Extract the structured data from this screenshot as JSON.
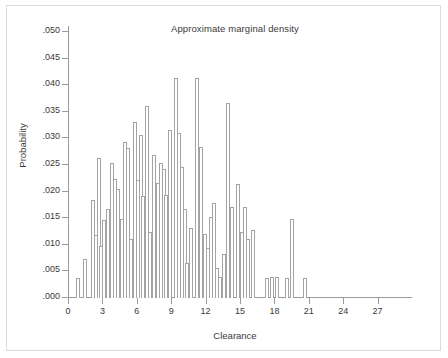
{
  "figure": {
    "title": "Approximate marginal density",
    "x_axis_label": "Clearance",
    "y_axis_label": "Probability",
    "border_color": "#dcdcdc",
    "axis_color": "#9a9a9a",
    "bar_outline_color": "#a3a3a3",
    "bar_fill_color": "#ffffff",
    "background_color": "#ffffff"
  },
  "chart_data": {
    "type": "bar",
    "title": "Approximate marginal density",
    "xlabel": "Clearance",
    "ylabel": "Probability",
    "xlim": [
      0,
      30
    ],
    "ylim": [
      0,
      0.05
    ],
    "grid": false,
    "legend": null,
    "x_ticks": [
      "0",
      "3",
      "6",
      "9",
      "12",
      "15",
      "18",
      "21",
      "24",
      "27"
    ],
    "x_tick_values": [
      0,
      3,
      6,
      9,
      12,
      15,
      18,
      21,
      24,
      27
    ],
    "y_ticks": [
      ".000",
      ".005",
      ".010",
      ".015",
      ".020",
      ".025",
      ".030",
      ".035",
      ".040",
      ".045",
      ".050"
    ],
    "y_tick_values": [
      0.0,
      0.005,
      0.01,
      0.015,
      0.02,
      0.025,
      0.03,
      0.035,
      0.04,
      0.045,
      0.05
    ],
    "bin_width": 0.33,
    "x": [
      0.83,
      1.5,
      2.17,
      2.33,
      2.67,
      3.0,
      3.17,
      3.5,
      3.83,
      4.0,
      4.33,
      4.67,
      5.0,
      5.17,
      5.5,
      5.83,
      6.0,
      6.33,
      6.5,
      6.83,
      7.0,
      7.17,
      7.5,
      7.83,
      8.0,
      8.33,
      8.5,
      8.83,
      9.0,
      9.17,
      9.5,
      9.83,
      10.0,
      10.33,
      10.5,
      10.83,
      11.0,
      11.33,
      11.5,
      11.83,
      12.0,
      12.33,
      12.5,
      12.83,
      13.0,
      13.33,
      13.5,
      13.83,
      14.0,
      14.33,
      14.5,
      14.83,
      15.0,
      15.33,
      15.5,
      15.83,
      16.0,
      16.33,
      17.33,
      17.83,
      18.17,
      18.5,
      19.0,
      19.33,
      20.67
    ],
    "values": [
      0.0038,
      0.0074,
      0.0185,
      0.0119,
      0.0263,
      0.0098,
      0.0147,
      0.0167,
      0.0253,
      0.0223,
      0.0205,
      0.0148,
      0.0293,
      0.0282,
      0.011,
      0.0331,
      0.0221,
      0.0306,
      0.0191,
      0.0361,
      0.0124,
      0.0269,
      0.0216,
      0.0253,
      0.0243,
      0.0193,
      0.0315,
      0.0414,
      0.0311,
      0.0247,
      0.0167,
      0.0066,
      0.0131,
      0.0413,
      0.0284,
      0.012,
      0.0094,
      0.0152,
      0.0178,
      0.0057,
      0.0039,
      0.0082,
      0.0367,
      0.0172,
      0.0215,
      0.0124,
      0.0172,
      0.0111,
      0.0128,
      0.0038,
      0.0039,
      0.0039,
      0.0038,
      0.0148,
      0.0038,
      0.0,
      0.0,
      0.0,
      0.0038,
      0.0039,
      0.0039,
      0.0038,
      0.0148,
      0.0038,
      0.0
    ]
  },
  "bars": [
    {
      "x": 0.83,
      "v": 0.0038
    },
    {
      "x": 1.5,
      "v": 0.0074
    },
    {
      "x": 2.17,
      "v": 0.0185
    },
    {
      "x": 2.42,
      "v": 0.0119
    },
    {
      "x": 2.67,
      "v": 0.0263
    },
    {
      "x": 2.92,
      "v": 0.0098
    },
    {
      "x": 3.17,
      "v": 0.0147
    },
    {
      "x": 3.5,
      "v": 0.0167
    },
    {
      "x": 3.83,
      "v": 0.0253
    },
    {
      "x": 4.08,
      "v": 0.0223
    },
    {
      "x": 4.33,
      "v": 0.0205
    },
    {
      "x": 4.67,
      "v": 0.0148
    },
    {
      "x": 5.0,
      "v": 0.0293
    },
    {
      "x": 5.25,
      "v": 0.0282
    },
    {
      "x": 5.5,
      "v": 0.011
    },
    {
      "x": 5.83,
      "v": 0.0331
    },
    {
      "x": 6.08,
      "v": 0.0221
    },
    {
      "x": 6.33,
      "v": 0.0306
    },
    {
      "x": 6.58,
      "v": 0.0191
    },
    {
      "x": 6.92,
      "v": 0.0361
    },
    {
      "x": 7.17,
      "v": 0.0124
    },
    {
      "x": 7.5,
      "v": 0.0269
    },
    {
      "x": 7.83,
      "v": 0.0216
    },
    {
      "x": 8.08,
      "v": 0.0253
    },
    {
      "x": 8.33,
      "v": 0.0243
    },
    {
      "x": 8.58,
      "v": 0.0193
    },
    {
      "x": 8.92,
      "v": 0.0315
    },
    {
      "x": 9.42,
      "v": 0.0414
    },
    {
      "x": 9.67,
      "v": 0.0311
    },
    {
      "x": 9.92,
      "v": 0.0247
    },
    {
      "x": 10.17,
      "v": 0.0167
    },
    {
      "x": 10.42,
      "v": 0.0066
    },
    {
      "x": 10.75,
      "v": 0.0131
    },
    {
      "x": 11.25,
      "v": 0.0413
    },
    {
      "x": 11.58,
      "v": 0.0284
    },
    {
      "x": 11.92,
      "v": 0.012
    },
    {
      "x": 12.25,
      "v": 0.0094
    },
    {
      "x": 12.5,
      "v": 0.0152
    },
    {
      "x": 12.75,
      "v": 0.0178
    },
    {
      "x": 13.0,
      "v": 0.0057
    },
    {
      "x": 13.25,
      "v": 0.0039
    },
    {
      "x": 13.58,
      "v": 0.0082
    },
    {
      "x": 13.92,
      "v": 0.0367
    },
    {
      "x": 14.33,
      "v": 0.0172
    },
    {
      "x": 14.83,
      "v": 0.0215
    },
    {
      "x": 15.17,
      "v": 0.0124
    },
    {
      "x": 15.42,
      "v": 0.0172
    },
    {
      "x": 15.67,
      "v": 0.0111
    },
    {
      "x": 16.17,
      "v": 0.0128
    },
    {
      "x": 17.33,
      "v": 0.0038
    },
    {
      "x": 17.83,
      "v": 0.0039
    },
    {
      "x": 18.25,
      "v": 0.0039
    },
    {
      "x": 19.08,
      "v": 0.0038
    },
    {
      "x": 19.5,
      "v": 0.0148
    },
    {
      "x": 20.67,
      "v": 0.0038
    }
  ]
}
